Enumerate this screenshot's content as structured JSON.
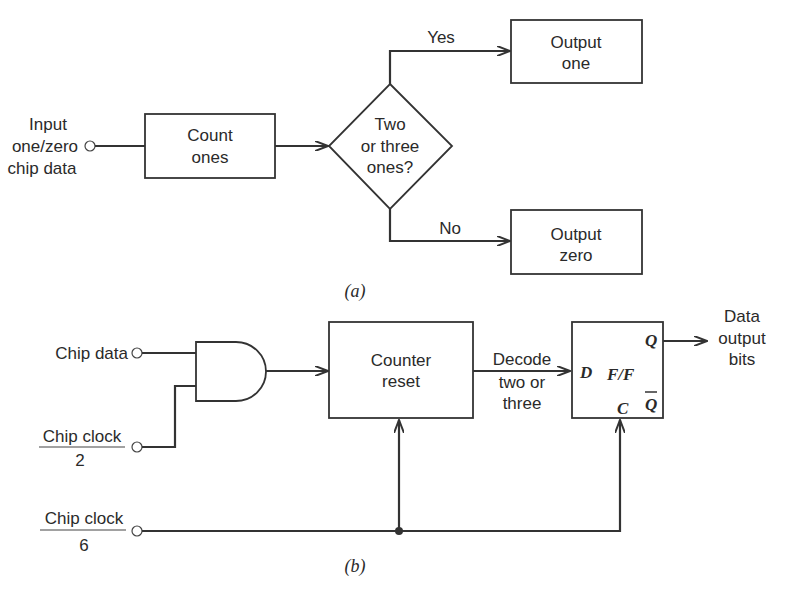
{
  "figure_a": {
    "caption": "(a)",
    "input_label": [
      "Input",
      "one/zero",
      "chip data"
    ],
    "count_box": [
      "Count",
      "ones"
    ],
    "decision": [
      "Two",
      "or three",
      "ones?"
    ],
    "yes_label": "Yes",
    "no_label": "No",
    "output_one": [
      "Output",
      "one"
    ],
    "output_zero": [
      "Output",
      "zero"
    ]
  },
  "figure_b": {
    "caption": "(b)",
    "chip_data_label": "Chip data",
    "chip_clock_2": {
      "numerator": "Chip clock",
      "denominator": "2"
    },
    "chip_clock_6": {
      "numerator": "Chip clock",
      "denominator": "6"
    },
    "counter_box": [
      "Counter",
      "reset"
    ],
    "decode_label": [
      "Decode",
      "two or",
      "three"
    ],
    "flipflop": {
      "d": "D",
      "name": "F/F",
      "c": "C",
      "q": "Q",
      "qbar": "Q"
    },
    "data_output": [
      "Data",
      "output",
      "bits"
    ]
  }
}
